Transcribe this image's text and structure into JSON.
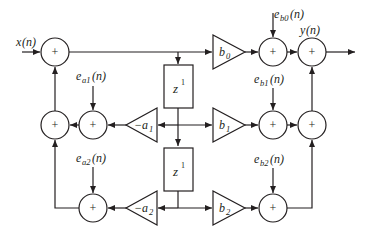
{
  "diagram": {
    "type": "signal-flow block diagram (cascade biquad with noise sources)",
    "colors": {
      "line": "#231f20",
      "background": "#ffffff"
    },
    "input": {
      "label": "x(n)",
      "base": "x",
      "arg": "(n)"
    },
    "output": {
      "label": "y(n)",
      "base": "y",
      "arg": "(n)"
    },
    "adder_symbol": "+",
    "delays": [
      {
        "label": "z^-1",
        "base": "z",
        "exp": "1"
      },
      {
        "label": "z^-1",
        "base": "z",
        "exp": "1"
      }
    ],
    "gains": {
      "b0": {
        "base": "b",
        "sub": "0"
      },
      "b1": {
        "base": "b",
        "sub": "1"
      },
      "b2": {
        "base": "b",
        "sub": "2"
      },
      "a1": {
        "prefix": "−",
        "base": "a",
        "sub": "1"
      },
      "a2": {
        "prefix": "−",
        "base": "a",
        "sub": "2"
      }
    },
    "noise_sources": {
      "ea1": {
        "base": "e",
        "sub": "a1",
        "arg": "(n)"
      },
      "ea2": {
        "base": "e",
        "sub": "a2",
        "arg": "(n)"
      },
      "eb0": {
        "base": "e",
        "sub": "b0",
        "arg": "(n)"
      },
      "eb1": {
        "base": "e",
        "sub": "b1",
        "arg": "(n)"
      },
      "eb2": {
        "base": "e",
        "sub": "b2",
        "arg": "(n)"
      }
    }
  }
}
